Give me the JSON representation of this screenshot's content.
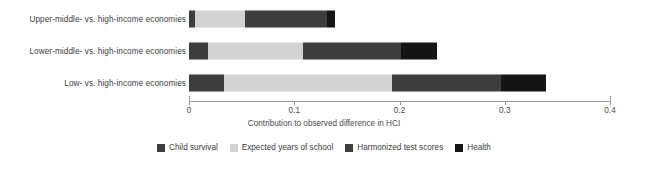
{
  "chart_data": {
    "type": "bar",
    "orientation": "horizontal",
    "stacked": true,
    "title": "",
    "subtitle": "",
    "xlabel": "Contribution to observed difference in HCI",
    "ylabel": "",
    "xlim": [
      0,
      0.4
    ],
    "xticks": [
      0,
      0.1,
      0.2,
      0.3,
      0.4
    ],
    "xtick_labels": [
      "0",
      "0.1",
      "0.2",
      "0.3",
      "0.4"
    ],
    "grid": false,
    "legend_position": "bottom",
    "categories": [
      "Upper-middle- vs. high-income economies",
      "Lower-middle- vs. high-income economies",
      "Low- vs. high-income economies"
    ],
    "series": [
      {
        "name": "Child survival",
        "color": "#3d3d3d",
        "values": [
          0.006,
          0.018,
          0.033
        ]
      },
      {
        "name": "Expected years of school",
        "color": "#d2d2d2",
        "values": [
          0.047,
          0.09,
          0.16
        ]
      },
      {
        "name": "Harmonized test scores",
        "color": "#3d3d3d",
        "values": [
          0.078,
          0.093,
          0.103
        ]
      },
      {
        "name": "Health",
        "color": "#151515",
        "values": [
          0.008,
          0.035,
          0.043
        ]
      }
    ],
    "totals": [
      0.139,
      0.236,
      0.339
    ]
  },
  "axis": {
    "title": "Contribution to observed difference in HCI",
    "ticks": [
      "0",
      "0.1",
      "0.2",
      "0.3",
      "0.4"
    ]
  },
  "legend": {
    "items": [
      {
        "label": "Child survival",
        "color": "#3d3d3d"
      },
      {
        "label": "Expected years of school",
        "color": "#d2d2d2"
      },
      {
        "label": "Harmonized test scores",
        "color": "#3d3d3d"
      },
      {
        "label": "Health",
        "color": "#151515"
      }
    ]
  },
  "rows": [
    {
      "label": "Upper-middle- vs. high-income economies"
    },
    {
      "label": "Lower-middle- vs. high-income economies"
    },
    {
      "label": "Low- vs. high-income economies"
    }
  ]
}
